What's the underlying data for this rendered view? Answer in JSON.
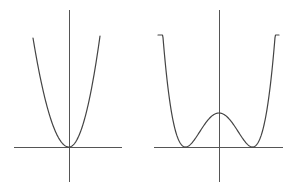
{
  "colors": {
    "background": "#ffffff",
    "axis": "#555555",
    "curve": "#444444"
  },
  "chart_data": [
    {
      "type": "line",
      "title": "",
      "description": "Single-well parabola-like curve (e.g. y = x^4 or y = x^2) with minimum at origin",
      "xlabel": "",
      "ylabel": "",
      "grid": false,
      "legend": null,
      "function": "y = x^2",
      "x": [
        -1.0,
        -0.8,
        -0.6,
        -0.4,
        -0.2,
        0.0,
        0.2,
        0.4,
        0.6,
        0.8,
        1.0
      ],
      "y": [
        1.0,
        0.64,
        0.36,
        0.16,
        0.04,
        0.0,
        0.04,
        0.16,
        0.36,
        0.64,
        1.0
      ],
      "pixel_frame": {
        "origin": [
          69,
          147
        ],
        "x_axis": [
          14,
          122
        ],
        "y_axis": [
          10,
          182
        ],
        "curve_left_top": [
          33,
          38
        ],
        "curve_right_top": [
          100,
          36
        ]
      }
    },
    {
      "type": "line",
      "title": "",
      "description": "Double-well potential curve with two minima touching the x-axis and a local maximum on the y-axis",
      "xlabel": "",
      "ylabel": "",
      "grid": false,
      "legend": null,
      "function": "y = (x^2 - 1)^2",
      "x": [
        -1.8,
        -1.6,
        -1.4,
        -1.2,
        -1.0,
        -0.8,
        -0.6,
        -0.4,
        -0.2,
        0.0,
        0.2,
        0.4,
        0.6,
        0.8,
        1.0,
        1.2,
        1.4,
        1.6,
        1.8
      ],
      "y": [
        5.02,
        2.43,
        0.92,
        0.19,
        0.0,
        0.13,
        0.41,
        0.71,
        0.92,
        1.0,
        0.92,
        0.71,
        0.41,
        0.13,
        0.0,
        0.19,
        0.92,
        2.43,
        5.02
      ],
      "pixel_frame": {
        "origin": [
          219,
          147
        ],
        "x_axis": [
          154,
          283
        ],
        "y_axis": [
          10,
          182
        ],
        "minima": [
          [
            185,
            147
          ],
          [
            252,
            147
          ]
        ],
        "local_max": [
          219,
          113
        ],
        "curve_left_top": [
          158,
          35
        ],
        "curve_right_top": [
          279,
          35
        ]
      }
    }
  ]
}
